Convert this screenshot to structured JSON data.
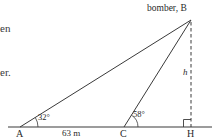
{
  "figure": {
    "type": "geometry-diagram",
    "apex_label": "bomber, B",
    "vertices": [
      {
        "id": "A",
        "label": "A",
        "x": 20,
        "y": 127
      },
      {
        "id": "C",
        "label": "C",
        "x": 124,
        "y": 127
      },
      {
        "id": "H",
        "label": "H",
        "x": 191,
        "y": 127
      },
      {
        "id": "B",
        "label": "B",
        "x": 191,
        "y": 20
      }
    ],
    "angles": [
      {
        "at": "A",
        "label": "32°",
        "value": 32
      },
      {
        "at": "C",
        "label": "58°",
        "value": 58
      }
    ],
    "right_angle": {
      "at": "H",
      "marker": "square"
    },
    "segments": [
      {
        "from": "A",
        "to": "B",
        "style": "solid"
      },
      {
        "from": "C",
        "to": "B",
        "style": "solid"
      },
      {
        "from": "B",
        "to": "H",
        "style": "dashed"
      }
    ],
    "baseline": {
      "from_x": 8,
      "to_x": 212,
      "y": 127,
      "style": "solid"
    },
    "measures": [
      {
        "label": "63 m",
        "between": "A-C",
        "value": 63,
        "unit": "m"
      },
      {
        "label": "h",
        "of": "B-H",
        "italic": true
      }
    ],
    "colors": {
      "ink": "#2a2a2a",
      "line": "#3a3a3a",
      "background": "#ffffff"
    }
  },
  "margin_text": {
    "line1": "en",
    "line2": "er."
  }
}
